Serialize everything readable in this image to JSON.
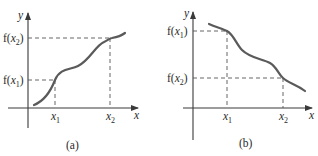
{
  "figure": {
    "panels": [
      {
        "id": "a",
        "caption": "(a)",
        "y_axis_label": "y",
        "x_axis_label": "x",
        "x_ticks": [
          {
            "var": "x",
            "sub": "1"
          },
          {
            "var": "x",
            "sub": "2"
          }
        ],
        "y_ticks": [
          {
            "text_pre": "f(",
            "var": "x",
            "sub": "1",
            "text_post": ")"
          },
          {
            "text_pre": "f(",
            "var": "x",
            "sub": "2",
            "text_post": ")"
          }
        ],
        "description": "increasing function: f(x1) < f(x2)"
      },
      {
        "id": "b",
        "caption": "(b)",
        "y_axis_label": "y",
        "x_axis_label": "x",
        "x_ticks": [
          {
            "var": "x",
            "sub": "1"
          },
          {
            "var": "x",
            "sub": "2"
          }
        ],
        "y_ticks": [
          {
            "text_pre": "f(",
            "var": "x",
            "sub": "1",
            "text_post": ")"
          },
          {
            "text_pre": "f(",
            "var": "x",
            "sub": "2",
            "text_post": ")"
          }
        ],
        "description": "decreasing function: f(x1) > f(x2)"
      }
    ]
  },
  "colors": {
    "axis": "#3a3a3a",
    "curve": "#5a5a5a",
    "dash": "#555555",
    "background": "#ffffff"
  }
}
